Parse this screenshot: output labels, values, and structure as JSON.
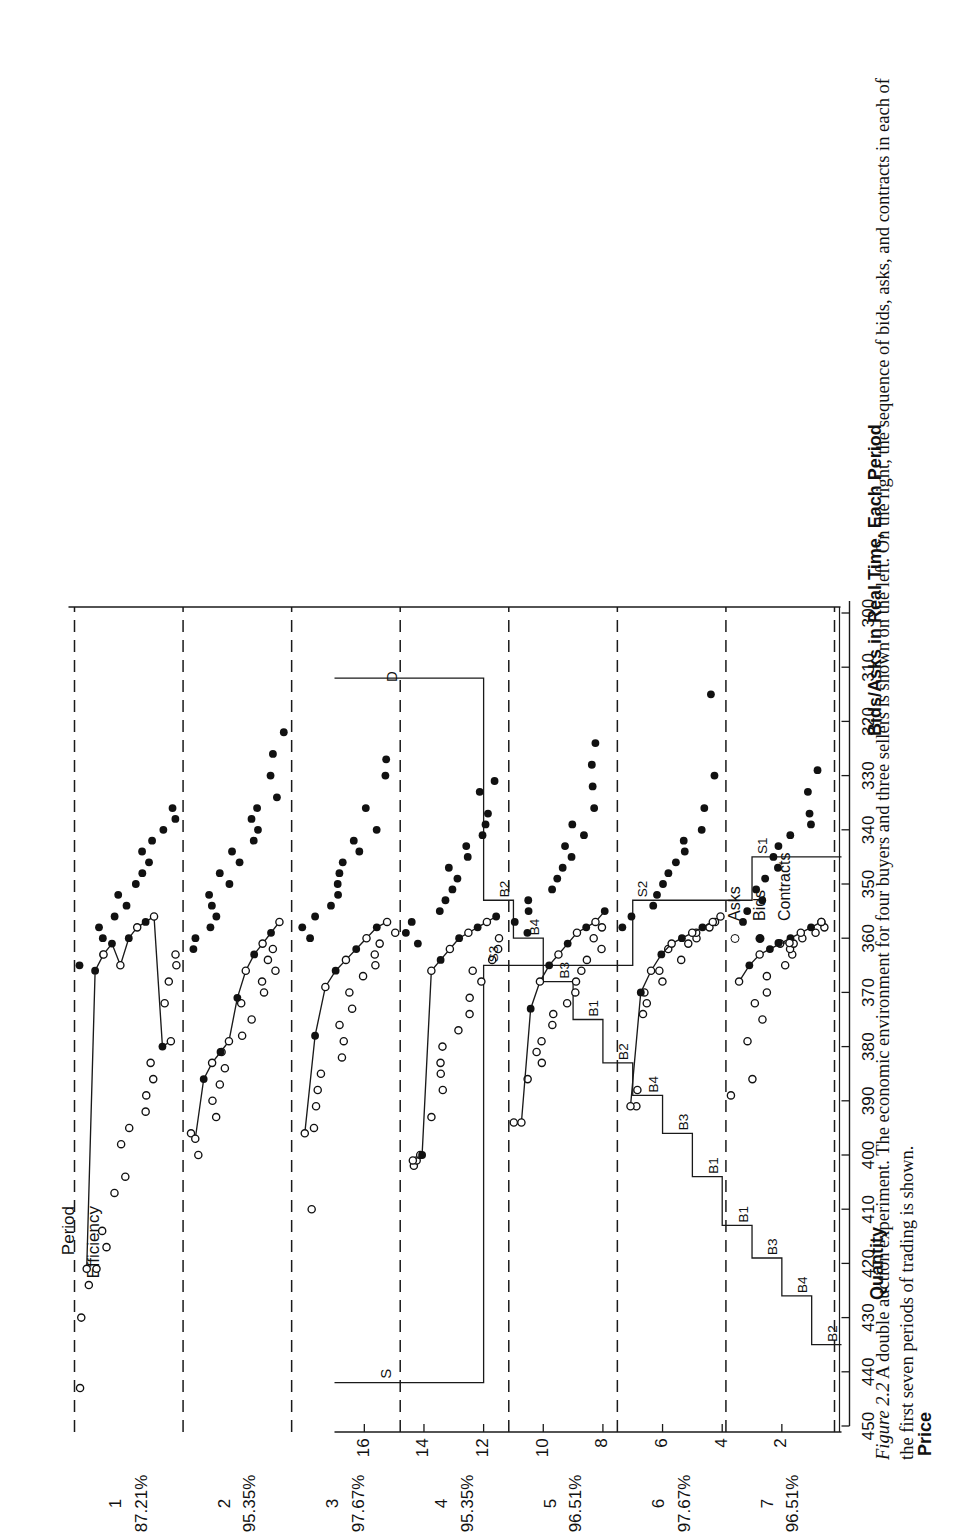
{
  "figure": {
    "number": "Figure 2.2",
    "caption": "A double auction experiment. The economic environment for four buyers and three sellers is shown on the left. On the right, the sequence of bids, asks, and contracts in each of the first seven periods of trading is shown."
  },
  "axes": {
    "price_label": "Price",
    "price_ticks": [
      450,
      440,
      430,
      420,
      410,
      400,
      390,
      380,
      370,
      360,
      350,
      340,
      330,
      320,
      310,
      300
    ],
    "price_min": 300,
    "price_max": 450,
    "quantity_label": "Quantity",
    "quantity_ticks": [
      2,
      4,
      6,
      8,
      10,
      12,
      14,
      16
    ],
    "quantity_min": 0,
    "quantity_max": 17
  },
  "headers": {
    "period_label": "Period",
    "efficiency_label": "Efficiency",
    "right_panel_title": "Bids/Asks in Real Time, Each Period"
  },
  "legend": {
    "items": [
      {
        "key": "asks",
        "label": "Asks",
        "marker": "open-circle-icon"
      },
      {
        "key": "bids",
        "label": "Bids",
        "marker": "filled-circle-icon"
      },
      {
        "key": "contracts",
        "label": "Contracts",
        "marker": "connected-dots-icon"
      }
    ]
  },
  "periods": [
    {
      "number": "1",
      "efficiency": "87.21%"
    },
    {
      "number": "2",
      "efficiency": "95.35%"
    },
    {
      "number": "3",
      "efficiency": "97.67%"
    },
    {
      "number": "4",
      "efficiency": "95.35%"
    },
    {
      "number": "5",
      "efficiency": "96.51%"
    },
    {
      "number": "6",
      "efficiency": "97.67%"
    },
    {
      "number": "7",
      "efficiency": "96.51%"
    }
  ],
  "curve_labels": {
    "supply": "S",
    "demand": "D",
    "supply_steps": [
      "S1",
      "S2",
      "S3"
    ],
    "demand_steps": [
      "B2",
      "B4",
      "B3",
      "B1",
      "B1",
      "B3",
      "B4",
      "B2",
      "B1",
      "B3",
      "B4",
      "B2"
    ]
  },
  "chart_data": {
    "type": "scatter",
    "title": "A double auction experiment",
    "xlabel": "Quantity",
    "ylabel": "Price",
    "ylim": [
      300,
      450
    ],
    "grid": false,
    "legend_position": "bottom-left",
    "supply_schedule": {
      "name": "S",
      "label": "S",
      "steps": [
        {
          "quantity_from": 0,
          "quantity_to": 3,
          "price": 345,
          "agent": "S1"
        },
        {
          "quantity_from": 3,
          "quantity_to": 7,
          "price": 353,
          "agent": "S2"
        },
        {
          "quantity_from": 7,
          "quantity_to": 12,
          "price": 365,
          "agent": "S3"
        },
        {
          "quantity_from": 12,
          "quantity_to": 17,
          "price": 442,
          "agent": "S"
        }
      ]
    },
    "demand_schedule": {
      "name": "D",
      "label": "D",
      "steps": [
        {
          "quantity_from": 0,
          "quantity_to": 1,
          "price": 435,
          "agent": "B2"
        },
        {
          "quantity_from": 1,
          "quantity_to": 2,
          "price": 426,
          "agent": "B4"
        },
        {
          "quantity_from": 2,
          "quantity_to": 3,
          "price": 419,
          "agent": "B3"
        },
        {
          "quantity_from": 3,
          "quantity_to": 4,
          "price": 413,
          "agent": "B1"
        },
        {
          "quantity_from": 4,
          "quantity_to": 5,
          "price": 404,
          "agent": "B1"
        },
        {
          "quantity_from": 5,
          "quantity_to": 6,
          "price": 396,
          "agent": "B3"
        },
        {
          "quantity_from": 6,
          "quantity_to": 7,
          "price": 389,
          "agent": "B4"
        },
        {
          "quantity_from": 7,
          "quantity_to": 8,
          "price": 383,
          "agent": "B2"
        },
        {
          "quantity_from": 8,
          "quantity_to": 9,
          "price": 375,
          "agent": "B1"
        },
        {
          "quantity_from": 9,
          "quantity_to": 10,
          "price": 368,
          "agent": "B3"
        },
        {
          "quantity_from": 10,
          "quantity_to": 11,
          "price": 360,
          "agent": "B4"
        },
        {
          "quantity_from": 11,
          "quantity_to": 12,
          "price": 353,
          "agent": "B2"
        },
        {
          "quantity_from": 12,
          "quantity_to": 17,
          "price": 312,
          "agent": "D"
        }
      ]
    },
    "period_series": [
      {
        "period": "1",
        "efficiency": "87.21%",
        "asks": [
          443,
          430,
          424,
          421,
          417,
          414,
          407,
          404,
          398,
          395,
          392,
          389,
          386,
          383,
          372,
          368,
          365,
          363
        ],
        "bids": [
          365,
          363,
          360,
          358,
          356,
          354,
          352,
          350,
          348,
          346,
          344,
          342,
          340,
          338,
          336
        ],
        "contracts": [
          421,
          366,
          363,
          361,
          365,
          360,
          358,
          357,
          356,
          380,
          379
        ]
      },
      {
        "period": "2",
        "efficiency": "95.35%",
        "asks": [
          400,
          396,
          393,
          390,
          387,
          384,
          381,
          378,
          375,
          372,
          370,
          368,
          366,
          364,
          362
        ],
        "bids": [
          362,
          360,
          358,
          356,
          354,
          352,
          350,
          348,
          346,
          344,
          342,
          340,
          338,
          336,
          334,
          330,
          326,
          322
        ],
        "contracts": [
          397,
          386,
          383,
          381,
          379,
          371,
          366,
          363,
          361,
          359,
          357
        ]
      },
      {
        "period": "3",
        "efficiency": "97.67%",
        "asks": [
          410,
          395,
          391,
          388,
          385,
          382,
          379,
          376,
          373,
          370,
          367,
          365,
          363,
          361,
          359
        ],
        "bids": [
          360,
          358,
          356,
          354,
          352,
          350,
          348,
          346,
          344,
          342,
          340,
          336,
          330,
          327
        ],
        "contracts": [
          396,
          378,
          369,
          366,
          364,
          362,
          360,
          358,
          357
        ]
      },
      {
        "period": "4",
        "efficiency": "95.35%",
        "asks": [
          402,
          401,
          400,
          393,
          388,
          385,
          383,
          380,
          377,
          374,
          371,
          368,
          366,
          364,
          362,
          360
        ],
        "bids": [
          361,
          359,
          357,
          355,
          353,
          351,
          349,
          347,
          345,
          343,
          341,
          339,
          337,
          333,
          331
        ],
        "contracts": [
          401,
          400,
          366,
          364,
          362,
          360,
          359,
          358,
          357,
          356
        ]
      },
      {
        "period": "5",
        "efficiency": "96.51%",
        "asks": [
          394,
          386,
          383,
          381,
          379,
          376,
          374,
          372,
          370,
          368,
          366,
          364,
          362,
          360,
          358
        ],
        "bids": [
          359,
          357,
          355,
          353,
          351,
          349,
          347,
          345,
          343,
          341,
          339,
          336,
          332,
          328,
          324
        ],
        "contracts": [
          394,
          373,
          368,
          365,
          363,
          361,
          359,
          358,
          357,
          355
        ]
      },
      {
        "period": "6",
        "efficiency": "97.67%",
        "asks": [
          391,
          388,
          374,
          372,
          370,
          368,
          366,
          364,
          362,
          361,
          360,
          359,
          358,
          357,
          356
        ],
        "bids": [
          358,
          356,
          354,
          352,
          350,
          348,
          346,
          344,
          342,
          340,
          336,
          330,
          315
        ],
        "contracts": [
          391,
          370,
          366,
          363,
          361,
          360,
          359,
          358,
          357
        ]
      },
      {
        "period": "7",
        "efficiency": "96.51%",
        "asks": [
          389,
          386,
          379,
          375,
          372,
          370,
          367,
          365,
          363,
          362,
          361,
          360,
          359,
          358,
          357
        ],
        "bids": [
          357,
          355,
          353,
          351,
          349,
          347,
          345,
          343,
          341,
          339,
          337,
          333,
          329
        ],
        "contracts": [
          368,
          365,
          363,
          362,
          361,
          360,
          359,
          358,
          357
        ]
      }
    ]
  }
}
